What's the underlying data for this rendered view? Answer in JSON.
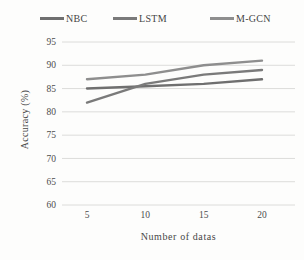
{
  "chart_data": {
    "type": "line",
    "title": "",
    "x": [
      5,
      10,
      15,
      20
    ],
    "xlabel": "Number of datas",
    "ylabel": "Accuracy (%)",
    "ylim": [
      60,
      95
    ],
    "yticks": [
      95,
      90,
      85,
      80,
      75,
      70,
      65,
      60
    ],
    "grid": true,
    "legend_position": "top",
    "series": [
      {
        "name": "NBC",
        "values": [
          85,
          85.5,
          86,
          87
        ],
        "color": "#6f6f6f"
      },
      {
        "name": "LSTM",
        "values": [
          82,
          86,
          88,
          89
        ],
        "color": "#7a7a7a"
      },
      {
        "name": "M-GCN",
        "values": [
          87,
          88,
          90,
          91
        ],
        "color": "#8e8e8e"
      }
    ]
  },
  "colors": {
    "gridline": "#dcdcda",
    "tick_text": "#4c4c4c",
    "background": "#fdfdfc"
  }
}
